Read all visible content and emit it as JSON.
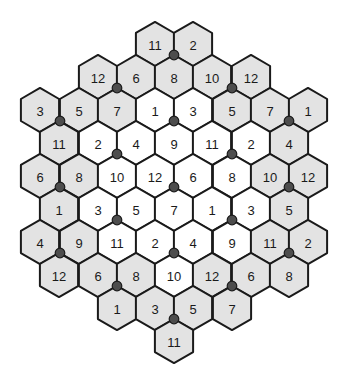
{
  "diagram": {
    "colors": {
      "outer_fill": "#e3e3e3",
      "inner_fill": "#ffffff",
      "stroke": "#1a1a1a",
      "dot": "#4d4d4d"
    },
    "geometry": {
      "hex_width": 38.3,
      "hex_radius": 22.1,
      "row_spacing": 33
    },
    "rows": [
      {
        "y": 44,
        "cells": [
          {
            "x": 155,
            "n": "11",
            "f": "outer"
          },
          {
            "x": 193,
            "n": "2",
            "f": "outer"
          }
        ]
      },
      {
        "y": 77,
        "cells": [
          {
            "x": 98,
            "n": "12",
            "f": "outer"
          },
          {
            "x": 136,
            "n": "6",
            "f": "outer"
          },
          {
            "x": 174,
            "n": "8",
            "f": "outer"
          },
          {
            "x": 212,
            "n": "10",
            "f": "outer"
          },
          {
            "x": 251,
            "n": "12",
            "f": "outer"
          }
        ]
      },
      {
        "y": 110,
        "cells": [
          {
            "x": 40,
            "n": "3",
            "f": "outer"
          },
          {
            "x": 79,
            "n": "5",
            "f": "outer"
          },
          {
            "x": 117,
            "n": "7",
            "f": "outer"
          },
          {
            "x": 155,
            "n": "1",
            "f": "inner"
          },
          {
            "x": 193,
            "n": "3",
            "f": "inner"
          },
          {
            "x": 232,
            "n": "5",
            "f": "outer"
          },
          {
            "x": 270,
            "n": "7",
            "f": "outer"
          },
          {
            "x": 308,
            "n": "1",
            "f": "outer"
          }
        ]
      },
      {
        "y": 143,
        "cells": [
          {
            "x": 59,
            "n": "11",
            "f": "outer"
          },
          {
            "x": 98,
            "n": "2",
            "f": "inner"
          },
          {
            "x": 136,
            "n": "4",
            "f": "inner"
          },
          {
            "x": 174,
            "n": "9",
            "f": "inner"
          },
          {
            "x": 212,
            "n": "11",
            "f": "inner"
          },
          {
            "x": 251,
            "n": "2",
            "f": "inner"
          },
          {
            "x": 289,
            "n": "4",
            "f": "outer"
          }
        ]
      },
      {
        "y": 176,
        "cells": [
          {
            "x": 40,
            "n": "6",
            "f": "outer"
          },
          {
            "x": 79,
            "n": "8",
            "f": "outer"
          },
          {
            "x": 117,
            "n": "10",
            "f": "inner"
          },
          {
            "x": 155,
            "n": "12",
            "f": "inner"
          },
          {
            "x": 193,
            "n": "6",
            "f": "inner"
          },
          {
            "x": 232,
            "n": "8",
            "f": "inner"
          },
          {
            "x": 270,
            "n": "10",
            "f": "outer"
          },
          {
            "x": 308,
            "n": "12",
            "f": "outer"
          }
        ]
      },
      {
        "y": 209,
        "cells": [
          {
            "x": 59,
            "n": "1",
            "f": "outer"
          },
          {
            "x": 98,
            "n": "3",
            "f": "inner"
          },
          {
            "x": 136,
            "n": "5",
            "f": "inner"
          },
          {
            "x": 174,
            "n": "7",
            "f": "inner"
          },
          {
            "x": 212,
            "n": "1",
            "f": "inner"
          },
          {
            "x": 251,
            "n": "3",
            "f": "inner"
          },
          {
            "x": 289,
            "n": "5",
            "f": "outer"
          }
        ]
      },
      {
        "y": 242,
        "cells": [
          {
            "x": 40,
            "n": "4",
            "f": "outer"
          },
          {
            "x": 79,
            "n": "9",
            "f": "outer"
          },
          {
            "x": 117,
            "n": "11",
            "f": "inner"
          },
          {
            "x": 155,
            "n": "2",
            "f": "inner"
          },
          {
            "x": 193,
            "n": "4",
            "f": "inner"
          },
          {
            "x": 232,
            "n": "9",
            "f": "inner"
          },
          {
            "x": 270,
            "n": "11",
            "f": "outer"
          },
          {
            "x": 308,
            "n": "2",
            "f": "outer"
          }
        ]
      },
      {
        "y": 275,
        "cells": [
          {
            "x": 59,
            "n": "12",
            "f": "outer"
          },
          {
            "x": 98,
            "n": "6",
            "f": "outer"
          },
          {
            "x": 136,
            "n": "8",
            "f": "outer"
          },
          {
            "x": 174,
            "n": "10",
            "f": "inner"
          },
          {
            "x": 212,
            "n": "12",
            "f": "outer"
          },
          {
            "x": 251,
            "n": "6",
            "f": "outer"
          },
          {
            "x": 289,
            "n": "8",
            "f": "outer"
          }
        ]
      },
      {
        "y": 308,
        "cells": [
          {
            "x": 117,
            "n": "1",
            "f": "outer"
          },
          {
            "x": 155,
            "n": "3",
            "f": "outer"
          },
          {
            "x": 193,
            "n": "5",
            "f": "outer"
          },
          {
            "x": 232,
            "n": "7",
            "f": "outer"
          }
        ]
      },
      {
        "y": 341,
        "cells": [
          {
            "x": 174,
            "n": "11",
            "f": "outer"
          }
        ]
      }
    ],
    "dots": [
      [
        174,
        55
      ],
      [
        117,
        88
      ],
      [
        232,
        88
      ],
      [
        60,
        121
      ],
      [
        174,
        121
      ],
      [
        289,
        121
      ],
      [
        117,
        154
      ],
      [
        232,
        154
      ],
      [
        60,
        187
      ],
      [
        174,
        187
      ],
      [
        289,
        187
      ],
      [
        117,
        220
      ],
      [
        232,
        220
      ],
      [
        60,
        253
      ],
      [
        174,
        253
      ],
      [
        289,
        253
      ],
      [
        117,
        286
      ],
      [
        232,
        286
      ],
      [
        174,
        319
      ]
    ]
  }
}
